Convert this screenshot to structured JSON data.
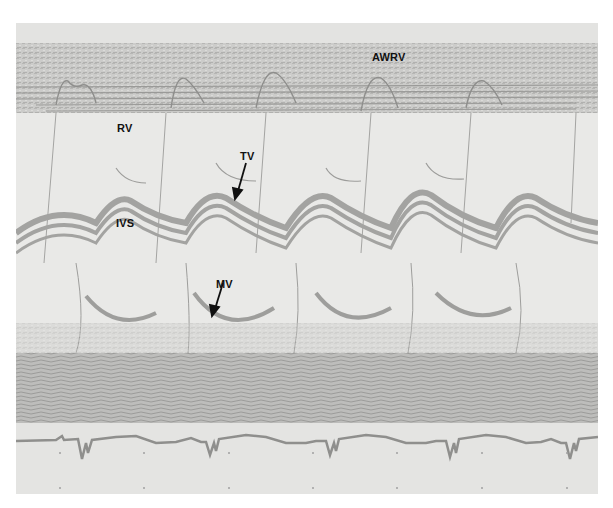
{
  "figure": {
    "type": "M-mode echocardiogram",
    "colors": {
      "background": "#e9e9e7",
      "echo_trace": "#9a9a98",
      "dense_tissue": "#b0b0ae",
      "label": "#111111",
      "ecg_trace": "#8f8f8d"
    },
    "labels": {
      "awrv": "AWRV",
      "rv": "RV",
      "tv": "TV",
      "ivs": "IVS",
      "mv": "MV"
    },
    "cycles": 5
  }
}
